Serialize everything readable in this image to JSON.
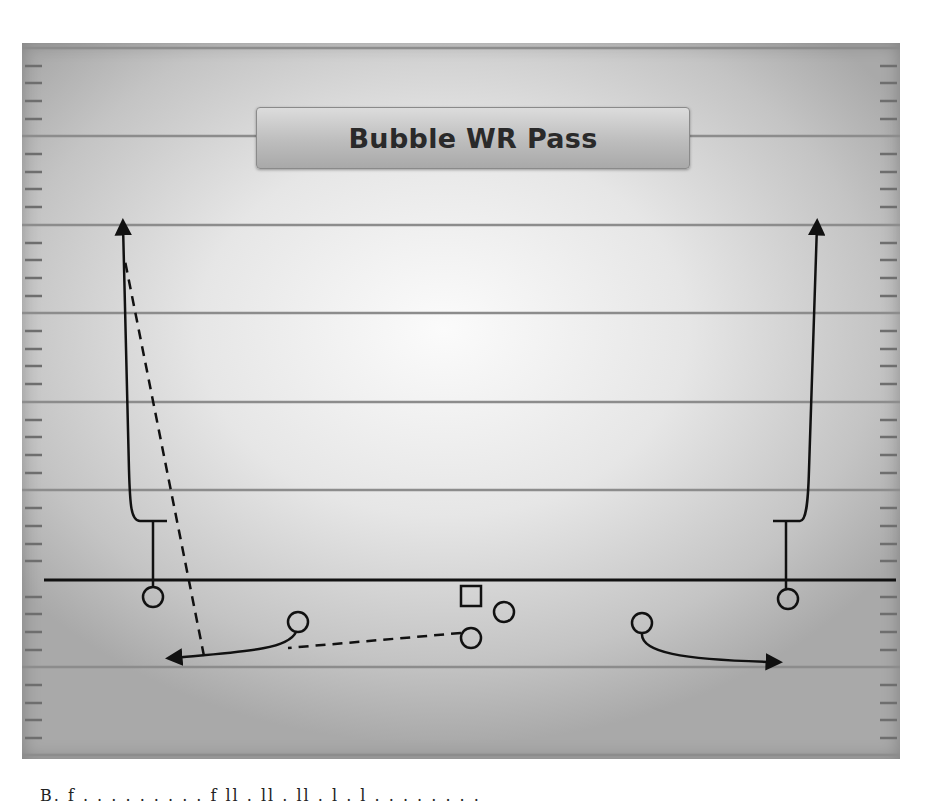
{
  "diagram": {
    "title": "Bubble WR Pass",
    "type": "football-play",
    "colors": {
      "field_light": "#fbfbfb",
      "field_dark": "#a9a9a9",
      "yard_line": "#8c8c8c",
      "ink": "#111111",
      "title_box": "#bdbdbd"
    },
    "field": {
      "yard_lines_y": [
        48,
        136,
        225,
        313,
        402,
        490,
        667,
        755
      ],
      "line_of_scrimmage_y": 580,
      "hash_marks": {
        "left_x": [
          25,
          42
        ],
        "right_x": [
          880,
          897
        ],
        "spacing": 17.7
      }
    },
    "players": [
      {
        "id": "left-wr",
        "shape": "circle",
        "x": 153,
        "y": 597,
        "r": 10,
        "role": "outside receiver left"
      },
      {
        "id": "left-slot",
        "shape": "circle",
        "x": 298,
        "y": 622,
        "r": 10,
        "role": "slot receiver left (bubble)"
      },
      {
        "id": "center",
        "shape": "square",
        "x": 471,
        "y": 597,
        "size": 20,
        "role": "center"
      },
      {
        "id": "qb",
        "shape": "circle",
        "x": 471,
        "y": 638,
        "r": 10,
        "role": "quarterback"
      },
      {
        "id": "back",
        "shape": "circle",
        "x": 504,
        "y": 612,
        "r": 10,
        "role": "running back"
      },
      {
        "id": "right-slot",
        "shape": "circle",
        "x": 642,
        "y": 623,
        "r": 10,
        "role": "slot receiver right (bubble)"
      },
      {
        "id": "right-wr",
        "shape": "circle",
        "x": 788,
        "y": 599,
        "r": 10,
        "role": "outside receiver right"
      }
    ],
    "routes": [
      {
        "id": "left-wr-release",
        "style": "solid",
        "kind": "block-then-go",
        "note": "stem to T, vertical with arrow"
      },
      {
        "id": "left-slot-bubble",
        "style": "solid",
        "kind": "bubble",
        "arrow": "left"
      },
      {
        "id": "qb-pitch",
        "style": "dashed",
        "kind": "pass",
        "note": "QB to bubble receiver"
      },
      {
        "id": "left-lateral",
        "style": "dashed",
        "kind": "lateral",
        "note": "bubble receiver throws back up to WR"
      },
      {
        "id": "right-slot-bubble",
        "style": "solid",
        "kind": "bubble",
        "arrow": "right"
      },
      {
        "id": "right-wr-release",
        "style": "solid",
        "kind": "block-then-go",
        "note": "stem to T, vertical with arrow"
      }
    ]
  },
  "caption": {
    "text": "B. f . . . . . . . . . f ll . ll . ll . l . l . . . . . . . ."
  }
}
